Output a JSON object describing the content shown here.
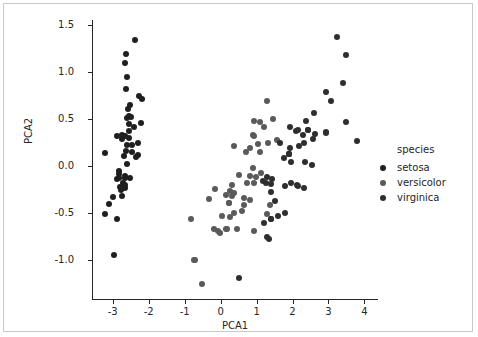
{
  "chart_data": {
    "type": "scatter",
    "title": "",
    "xlabel": "PCA1",
    "ylabel": "PCA2",
    "xlim": [
      -3.55,
      4.35
    ],
    "ylim": [
      -1.42,
      1.55
    ],
    "xticks": [
      "-3",
      "-2",
      "-1",
      "0",
      "1",
      "2",
      "3",
      "4"
    ],
    "xtick_values": [
      -3,
      -2,
      -1,
      0,
      1,
      2,
      3,
      4
    ],
    "yticks": [
      "1.5",
      "1.0",
      "0.5",
      "0.0",
      "-0.5",
      "-1.0"
    ],
    "ytick_values": [
      1.5,
      1.0,
      0.5,
      0.0,
      -0.5,
      -1.0
    ],
    "grid": false,
    "legend": {
      "title": "species",
      "position": "right-outside",
      "entries": [
        {
          "label": "setosa",
          "color": "#1f1f1f"
        },
        {
          "label": "versicolor",
          "color": "#5a5a5a"
        },
        {
          "label": "virginica",
          "color": "#2e2e2e"
        }
      ]
    },
    "series": [
      {
        "name": "setosa",
        "color": "#1f1f1f",
        "points": [
          [
            -2.68,
            0.32
          ],
          [
            -2.71,
            -0.18
          ],
          [
            -2.89,
            -0.14
          ],
          [
            -2.75,
            -0.32
          ],
          [
            -2.73,
            0.33
          ],
          [
            -2.28,
            0.74
          ],
          [
            -2.82,
            -0.09
          ],
          [
            -2.63,
            0.16
          ],
          [
            -2.89,
            -0.57
          ],
          [
            -2.67,
            -0.24
          ],
          [
            -2.51,
            0.65
          ],
          [
            -2.61,
            0.02
          ],
          [
            -2.79,
            -0.23
          ],
          [
            -3.22,
            -0.51
          ],
          [
            -2.64,
            1.19
          ],
          [
            -2.38,
            1.34
          ],
          [
            -2.62,
            0.82
          ],
          [
            -2.65,
            0.32
          ],
          [
            -2.2,
            0.71
          ],
          [
            -2.59,
            0.6
          ],
          [
            -2.31,
            0.24
          ],
          [
            -2.54,
            0.53
          ],
          [
            -3.22,
            0.13
          ],
          [
            -2.3,
            0.11
          ],
          [
            -2.36,
            0.09
          ],
          [
            -2.51,
            -0.13
          ],
          [
            -2.47,
            0.14
          ],
          [
            -2.56,
            0.37
          ],
          [
            -2.56,
            0.29
          ],
          [
            -2.67,
            -0.11
          ],
          [
            -2.65,
            -0.13
          ],
          [
            -2.4,
            0.41
          ],
          [
            -2.61,
            0.94
          ],
          [
            -2.65,
            1.09
          ],
          [
            -2.65,
            -0.21
          ],
          [
            -2.84,
            -0.06
          ],
          [
            -2.6,
            0.51
          ],
          [
            -2.87,
            0.31
          ],
          [
            -3.11,
            -0.41
          ],
          [
            -2.6,
            0.22
          ],
          [
            -2.74,
            0.28
          ],
          [
            -2.97,
            -0.95
          ],
          [
            -2.98,
            -0.33
          ],
          [
            -2.46,
            0.22
          ],
          [
            -2.21,
            0.45
          ],
          [
            -2.78,
            -0.26
          ],
          [
            -2.49,
            0.52
          ],
          [
            -2.84,
            -0.13
          ],
          [
            -2.55,
            0.44
          ],
          [
            -2.68,
            0.1
          ]
        ]
      },
      {
        "name": "versicolor",
        "color": "#5a5a5a",
        "points": [
          [
            1.28,
            0.69
          ],
          [
            0.93,
            0.32
          ],
          [
            1.46,
            0.5
          ],
          [
            0.18,
            -0.68
          ],
          [
            1.09,
            0.15
          ],
          [
            0.64,
            -0.42
          ],
          [
            1.1,
            0.46
          ],
          [
            -0.75,
            -1.0
          ],
          [
            1.04,
            0.23
          ],
          [
            -0.01,
            -0.72
          ],
          [
            -0.51,
            -1.26
          ],
          [
            0.51,
            -0.1
          ],
          [
            0.26,
            -0.55
          ],
          [
            0.98,
            -0.12
          ],
          [
            -0.17,
            -0.25
          ],
          [
            0.93,
            0.47
          ],
          [
            0.66,
            -0.35
          ],
          [
            0.23,
            -0.4
          ],
          [
            0.94,
            -0.7
          ],
          [
            0.04,
            -0.54
          ],
          [
            1.12,
            -0.08
          ],
          [
            0.36,
            0.21
          ],
          [
            1.3,
            -0.51
          ],
          [
            0.92,
            -0.18
          ],
          [
            0.71,
            0.15
          ],
          [
            0.9,
            0.33
          ],
          [
            1.33,
            0.24
          ],
          [
            1.56,
            0.27
          ],
          [
            0.81,
            -0.11
          ],
          [
            -0.31,
            -0.36
          ],
          [
            -0.07,
            -0.7
          ],
          [
            -0.19,
            -0.67
          ],
          [
            0.14,
            -0.31
          ],
          [
            1.38,
            -0.42
          ],
          [
            0.59,
            -0.48
          ],
          [
            0.81,
            0.19
          ],
          [
            1.22,
            0.41
          ],
          [
            0.81,
            -0.37
          ],
          [
            0.25,
            -0.27
          ],
          [
            0.16,
            -0.68
          ],
          [
            0.46,
            -0.67
          ],
          [
            0.89,
            -0.03
          ],
          [
            0.23,
            -0.4
          ],
          [
            -0.71,
            -1.01
          ],
          [
            0.36,
            -0.5
          ],
          [
            0.33,
            -0.21
          ],
          [
            0.37,
            -0.29
          ],
          [
            0.72,
            -0.18
          ],
          [
            -0.82,
            -0.57
          ],
          [
            0.31,
            -0.32
          ]
        ]
      },
      {
        "name": "virginica",
        "color": "#2e2e2e",
        "points": [
          [
            2.53,
            0.01
          ],
          [
            1.41,
            -0.57
          ],
          [
            2.62,
            0.34
          ],
          [
            1.97,
            -0.18
          ],
          [
            2.35,
            0.04
          ],
          [
            3.4,
            0.88
          ],
          [
            0.52,
            -1.2
          ],
          [
            2.93,
            0.36
          ],
          [
            2.32,
            -0.24
          ],
          [
            2.92,
            0.78
          ],
          [
            1.66,
            0.24
          ],
          [
            1.8,
            -0.22
          ],
          [
            2.17,
            0.21
          ],
          [
            1.34,
            -0.78
          ],
          [
            1.59,
            -0.54
          ],
          [
            1.9,
            0.12
          ],
          [
            1.95,
            0.04
          ],
          [
            3.49,
            1.18
          ],
          [
            3.8,
            0.26
          ],
          [
            1.3,
            -0.76
          ],
          [
            2.43,
            0.38
          ],
          [
            1.2,
            -0.61
          ],
          [
            3.5,
            0.46
          ],
          [
            1.39,
            -0.2
          ],
          [
            2.28,
            0.33
          ],
          [
            2.61,
            0.56
          ],
          [
            1.26,
            -0.18
          ],
          [
            1.29,
            -0.12
          ],
          [
            2.12,
            -0.21
          ],
          [
            2.38,
            0.47
          ],
          [
            2.94,
            0.35
          ],
          [
            3.23,
            1.37
          ],
          [
            2.15,
            -0.22
          ],
          [
            1.44,
            -0.14
          ],
          [
            1.78,
            -0.5
          ],
          [
            3.07,
            0.69
          ],
          [
            2.14,
            0.38
          ],
          [
            1.9,
            0.12
          ],
          [
            1.17,
            -0.16
          ],
          [
            2.11,
            0.37
          ],
          [
            2.31,
            0.24
          ],
          [
            1.92,
            0.41
          ],
          [
            1.41,
            -0.57
          ],
          [
            2.56,
            0.28
          ],
          [
            2.42,
            0.38
          ],
          [
            1.94,
            0.19
          ],
          [
            1.52,
            -0.38
          ],
          [
            1.76,
            0.08
          ],
          [
            1.9,
            0.12
          ],
          [
            1.39,
            -0.28
          ]
        ]
      }
    ]
  }
}
